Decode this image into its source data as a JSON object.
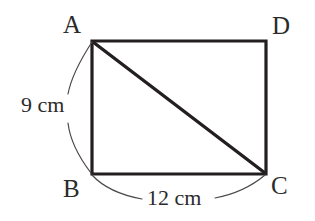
{
  "figure": {
    "type": "rectangle-with-diagonal",
    "shape_name": "rectangle ABCD",
    "stroke_color": "#231f20",
    "background_color": "#ffffff",
    "vertices": [
      {
        "id": "A",
        "label": "A",
        "x": 92,
        "y": 41
      },
      {
        "id": "D",
        "label": "D",
        "x": 266,
        "y": 41
      },
      {
        "id": "B",
        "label": "B",
        "x": 92,
        "y": 174
      },
      {
        "id": "C",
        "label": "C",
        "x": 266,
        "y": 174
      }
    ],
    "edges": [
      {
        "from": "A",
        "to": "D"
      },
      {
        "from": "D",
        "to": "C"
      },
      {
        "from": "C",
        "to": "B"
      },
      {
        "from": "B",
        "to": "A"
      }
    ],
    "diagonal": {
      "from": "A",
      "to": "C"
    },
    "measurements": [
      {
        "id": "side-ab",
        "label": "9 cm",
        "value": 9,
        "unit": "cm",
        "side": "AB",
        "position": "left"
      },
      {
        "id": "side-bc",
        "label": "12 cm",
        "value": 12,
        "unit": "cm",
        "side": "BC",
        "position": "bottom"
      }
    ]
  }
}
